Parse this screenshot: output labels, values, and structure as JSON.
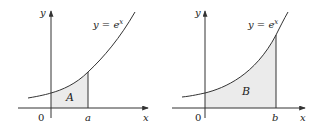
{
  "figures": [
    {
      "id": "left",
      "curve_label": "y = e",
      "curve_exponent": "x",
      "region_label": "A",
      "axis_y_label": "y",
      "axis_x_label": "x",
      "origin_label": "0",
      "bound_label": "a",
      "fill_color": "#ebebeb",
      "stroke_color": "#333333"
    },
    {
      "id": "right",
      "curve_label": "y = e",
      "curve_exponent": "x",
      "region_label": "B",
      "axis_y_label": "y",
      "axis_x_label": "x",
      "origin_label": "0",
      "bound_label": "b",
      "fill_color": "#ebebeb",
      "stroke_color": "#333333"
    }
  ]
}
